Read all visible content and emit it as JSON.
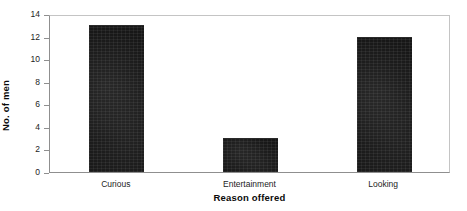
{
  "chart_data": {
    "type": "bar",
    "title": "",
    "subtitle": "",
    "categories": [
      "Curious",
      "Entertainment",
      "Looking"
    ],
    "values": [
      13,
      3,
      12
    ],
    "xlabel": "Reason offered",
    "ylabel": "No. of men",
    "ylim": [
      0,
      14
    ],
    "ytick_labels": [
      "0",
      "2",
      "4",
      "6",
      "8",
      "10",
      "12",
      "14"
    ],
    "ytick_values": [
      0,
      2,
      4,
      6,
      8,
      10,
      12,
      14
    ],
    "grid": false,
    "legend": false,
    "legend_position": "none",
    "bar_color": "#171717",
    "axis_color": "#8f8f8f",
    "frame": true,
    "annotations": []
  },
  "axes": {
    "y_title": "No. of men",
    "x_title": "Reason offered"
  }
}
